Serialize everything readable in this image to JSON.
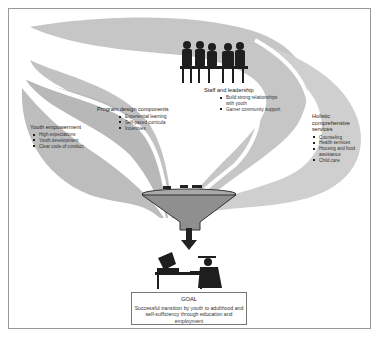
{
  "diagram": {
    "colors": {
      "ribbon": "#bdbdbd",
      "ribbon_light": "#cfcfcf",
      "funnel": "#8f8f8f",
      "silhouette": "#1e1e1e",
      "border": "#9a9a9a"
    },
    "sections": [
      {
        "id": "youth-empowerment",
        "title": "Youth empowerment",
        "items": [
          "High expectations",
          "Youth development",
          "Clear code of conduct"
        ]
      },
      {
        "id": "program-design",
        "title": "Program design components",
        "items": [
          "Experiential learning",
          "Self-paced curricula",
          "Incentives"
        ]
      },
      {
        "id": "staff-leadership",
        "title": "Staff and leadership",
        "items": [
          "Build strong relationships with youth",
          "Garner community support"
        ]
      },
      {
        "id": "holistic-services",
        "title": "Holistic comprehensive services",
        "items": [
          "Counseling",
          "Health services",
          "Housing and food assistance",
          "Child care"
        ]
      }
    ],
    "goal": {
      "title": "GOAL",
      "text": "Successful transition by youth to adulthood and self-sufficiency through education and employment"
    },
    "icons": [
      "meeting-group-silhouette-icon",
      "funnel-icon",
      "down-arrow-icon",
      "graduate-at-computer-icon"
    ]
  }
}
